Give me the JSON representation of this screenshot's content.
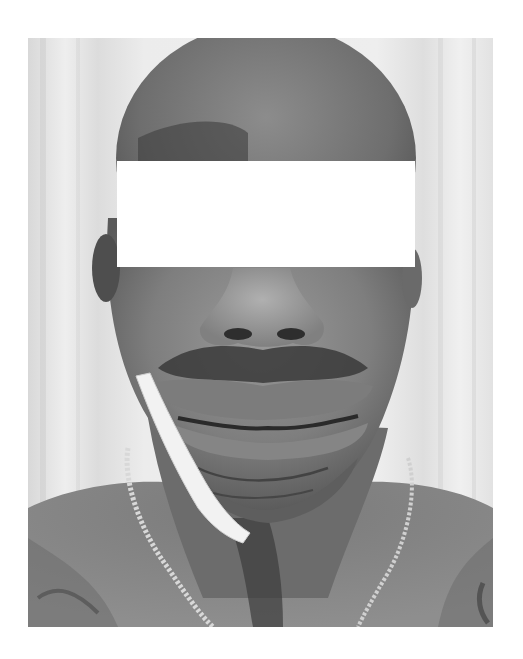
{
  "image": {
    "kind": "clinical-photograph",
    "color_mode": "grayscale",
    "alt": "Frontal clinical photograph of a patient's face and upper chest with eyes redacted by a white rectangle; swelling of the lips and chin, white dressing strip along the left jaw, chain necklace around the neck",
    "subject": {
      "visible_features": [
        "bald head",
        "nose",
        "mustache",
        "swollen lips",
        "swollen chin",
        "neck",
        "shoulders",
        "chain necklace",
        "white dressing strip"
      ],
      "background": "light curtain"
    },
    "redaction": {
      "color": "#ffffff",
      "purpose": "eye anonymization"
    },
    "colors": {
      "page_background": "#ffffff",
      "curtain": "#e6e6e6",
      "skin_mid": "#7a7a7a",
      "skin_dark": "#4a4a4a",
      "skin_light": "#9a9a9a",
      "dressing": "#f2f2f2"
    }
  }
}
